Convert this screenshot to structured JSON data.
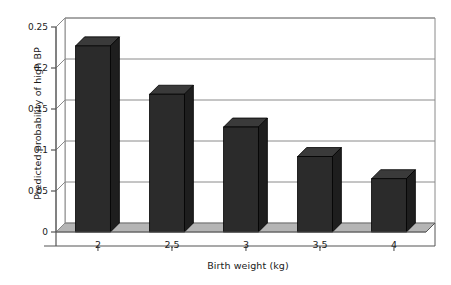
{
  "chart_data": {
    "type": "bar",
    "style": "3d-column",
    "title": "",
    "subtitle": "",
    "xlabel": "Birth weight (kg)",
    "ylabel": "Predicted probability of high BP",
    "categories": [
      "2",
      "2.5",
      "3",
      "3.5",
      "4"
    ],
    "values": [
      0.227,
      0.168,
      0.128,
      0.092,
      0.065
    ],
    "series": [
      {
        "name": "Predicted probability of high BP",
        "values": [
          0.227,
          0.168,
          0.128,
          0.092,
          0.065
        ]
      }
    ],
    "ylim": [
      0,
      0.25
    ],
    "xlim_categories": 5,
    "yticks": [
      "0",
      "0.05",
      "0.1",
      "0.15",
      "0.2",
      "0.25"
    ],
    "ytick_values": [
      0,
      0.05,
      0.1,
      0.15,
      0.2,
      0.25
    ],
    "grid": "horizontal",
    "legend": "none",
    "annotations": [],
    "colors": {
      "bar_front": "#2b2b2b",
      "bar_side": "#1e1e1e",
      "bar_top": "#3a3a3a",
      "floor": "#b5b5b5",
      "floor_edge": "#8d8d8d",
      "gridline": "#8a8a8a",
      "axis": "#555555",
      "text": "#1a1a1a",
      "background": "#ffffff"
    }
  }
}
